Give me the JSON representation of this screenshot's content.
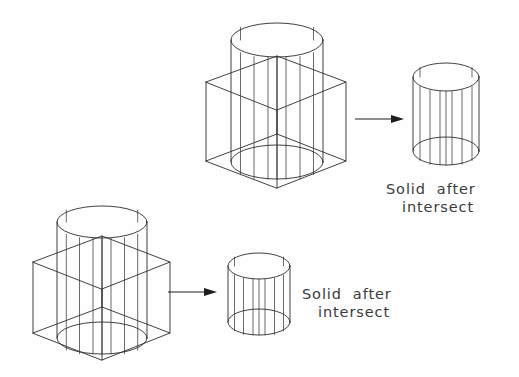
{
  "figure": {
    "background_color": "#fefefe",
    "line_color": "#2b2b2b",
    "text_color": "#3b3b3b",
    "width": 519,
    "height": 377
  },
  "rows": [
    {
      "id": "row-top",
      "operands": {
        "name": "box-cylinder-intersection-top",
        "primitives": [
          "box",
          "cylinder"
        ],
        "description": "Wireframe box intersected with a taller wireframe cylinder"
      },
      "arrow": {
        "name": "arrow-top",
        "direction": "right"
      },
      "result": {
        "name": "result-cylinder-top",
        "primitive": "cylinder",
        "generator_lines": 9
      },
      "caption": {
        "line1": "Solid  after",
        "line2": "intersect"
      }
    },
    {
      "id": "row-bottom",
      "operands": {
        "name": "box-cylinder-intersection-bottom",
        "primitives": [
          "box",
          "cylinder"
        ],
        "description": "Wireframe box intersected with a taller wireframe cylinder"
      },
      "arrow": {
        "name": "arrow-bottom",
        "direction": "right"
      },
      "result": {
        "name": "result-cylinder-bottom",
        "primitive": "cylinder",
        "generator_lines": 9
      },
      "caption": {
        "line1": "Solid  after",
        "line2": "intersect"
      }
    }
  ]
}
